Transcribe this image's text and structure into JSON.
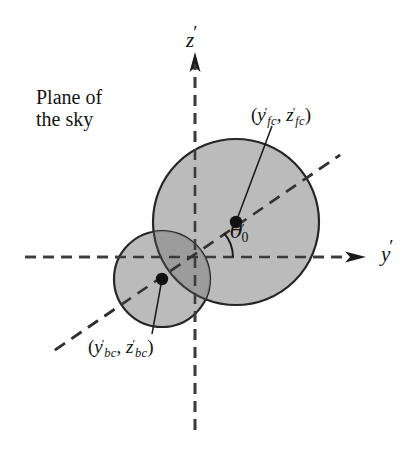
{
  "figure": {
    "background_color": "#ffffff",
    "stroke_color": "#1a1a1a",
    "circle_fill_color": "#b9b9b9",
    "overlap_fill_color": "#9a9a9a"
  },
  "axes": {
    "vertical": {
      "label": "z",
      "prime": "′",
      "style": "dashed",
      "arrow": "up",
      "origin_px": [
        195,
        257
      ],
      "tip_px": [
        195,
        58
      ],
      "tail_px": [
        195,
        430
      ]
    },
    "horizontal": {
      "label": "y",
      "prime": "′",
      "style": "dashed",
      "arrow": "right",
      "origin_px": [
        195,
        257
      ],
      "tip_px": [
        355,
        257
      ],
      "tail_px": [
        25,
        257
      ]
    }
  },
  "annotations": {
    "plane_of_sky": {
      "line1": "Plane of",
      "line2": "the sky"
    },
    "front_component": {
      "open_paren": "(",
      "y_symbol": "y",
      "y_prime": "′",
      "y_subscript": "fc",
      "separator": ", ",
      "z_symbol": "z",
      "z_prime": "′",
      "z_subscript": "fc",
      "close_paren": ")",
      "full_text": "(y′fc, z′fc)"
    },
    "back_component": {
      "open_paren": "(",
      "y_symbol": "y",
      "y_prime": "′",
      "y_subscript": "bc",
      "separator": ", ",
      "z_symbol": "z",
      "z_prime": "′",
      "z_subscript": "bc",
      "close_paren": ")",
      "full_text": "(y′bc, z′bc)"
    },
    "angle": {
      "symbol": "θ",
      "prime": "′",
      "subscript": "0",
      "full_text": "θ′0",
      "value_degrees": 40
    }
  },
  "shapes": {
    "front_circle": {
      "name": "front-component-disk",
      "center_px": [
        236,
        222
      ],
      "radius_px": 83,
      "fill": "#b9b9b9",
      "stroke": "#1a1a1a"
    },
    "back_circle": {
      "name": "back-component-disk",
      "center_px": [
        162,
        279
      ],
      "radius_px": 48,
      "fill": "#b9b9b9",
      "stroke": "#1a1a1a"
    },
    "center_dots": [
      {
        "name": "front-component-center",
        "center_px": [
          236,
          222
        ],
        "radius_px": 6
      },
      {
        "name": "back-component-center",
        "center_px": [
          162,
          279
        ],
        "radius_px": 6
      }
    ],
    "orbit_line": {
      "name": "line-of-centers",
      "style": "dashed",
      "from_px": [
        55,
        350
      ],
      "to_px": [
        340,
        155
      ]
    },
    "leader_lines": [
      {
        "name": "front-label-leader",
        "from_px": [
          236,
          222
        ],
        "to_px": [
          272,
          124
        ]
      },
      {
        "name": "back-label-leader",
        "from_px": [
          162,
          279
        ],
        "to_px": [
          152,
          334
        ]
      }
    ]
  }
}
